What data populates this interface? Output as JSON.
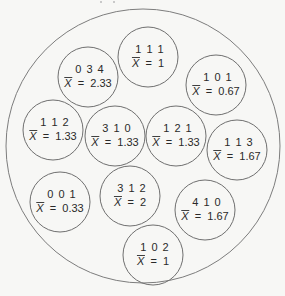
{
  "diagram": {
    "type": "sampling-distribution-population",
    "statistic_symbol": "X",
    "statistic_label": "sample mean",
    "samples": [
      {
        "values": "0 3 4",
        "mean": "2.33"
      },
      {
        "values": "1 1 1",
        "mean": "1"
      },
      {
        "values": "1 0 1",
        "mean": "0.67"
      },
      {
        "values": "1 1 2",
        "mean": "1.33"
      },
      {
        "values": "3 1 0",
        "mean": "1.33"
      },
      {
        "values": "1 2 1",
        "mean": "1.33"
      },
      {
        "values": "1 1 3",
        "mean": "1.67"
      },
      {
        "values": "0 0 1",
        "mean": "0.33"
      },
      {
        "values": "3 1 2",
        "mean": "2"
      },
      {
        "values": "4 1 0",
        "mean": "1.67"
      },
      {
        "values": "1 0 2",
        "mean": "1"
      }
    ]
  }
}
